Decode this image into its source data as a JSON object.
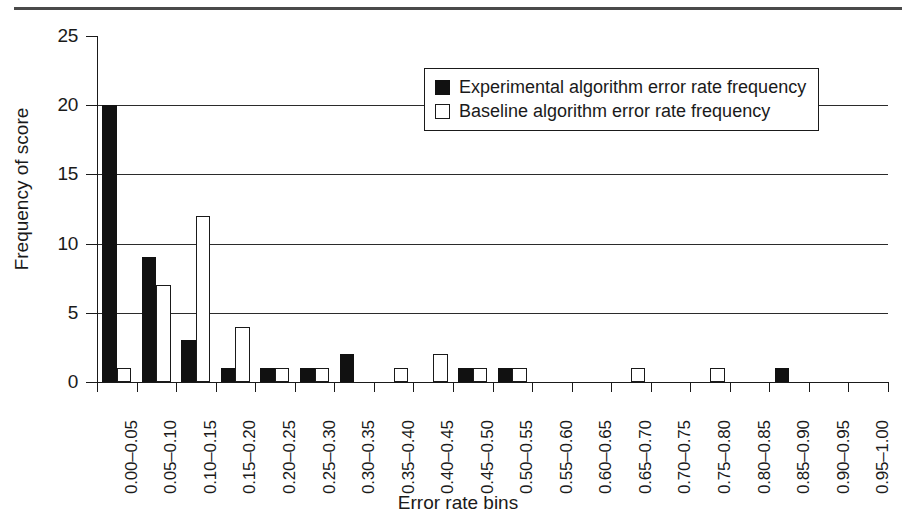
{
  "chart_data": {
    "type": "bar",
    "title": "",
    "xlabel": "Error rate bins",
    "ylabel": "Frequency of score",
    "ylim": [
      0,
      25
    ],
    "yticks": [
      0,
      5,
      10,
      15,
      20,
      25
    ],
    "gridlines": [
      5,
      10,
      15,
      20
    ],
    "grid": true,
    "legend_position": "upper-right-inside",
    "categories": [
      "0.00–0.05",
      "0.05–0.10",
      "0.10–0.15",
      "0.15–0.20",
      "0.20–0.25",
      "0.25–0.30",
      "0.30–0.35",
      "0.35–0.40",
      "0.40–0.45",
      "0.45–0.50",
      "0.50–0.55",
      "0.55–0.60",
      "0.60–0.65",
      "0.65–0.70",
      "0.70–0.75",
      "0.75–0.80",
      "0.80–0.85",
      "0.85–0.90",
      "0.90–0.95",
      "0.95–1.00"
    ],
    "series": [
      {
        "name": "Experimental algorithm error rate frequency",
        "color": "#111111",
        "style": "filled",
        "values": [
          20,
          9,
          3,
          1,
          1,
          1,
          2,
          0,
          0,
          1,
          1,
          0,
          0,
          0,
          0,
          0,
          0,
          1,
          0,
          0
        ]
      },
      {
        "name": "Baseline algorithm error rate frequency",
        "color": "#ffffff",
        "style": "outlined",
        "values": [
          1,
          7,
          12,
          4,
          1,
          1,
          0,
          1,
          2,
          1,
          1,
          0,
          0,
          1,
          0,
          1,
          0,
          0,
          0,
          0
        ]
      }
    ]
  },
  "legend": {
    "items": [
      {
        "label": "Experimental algorithm error rate frequency",
        "swatch": "filled-square"
      },
      {
        "label": "Baseline algorithm error rate frequency",
        "swatch": "open-square"
      }
    ]
  },
  "axes": {
    "y_title": "Frequency of score",
    "x_title": "Error rate bins",
    "y_tick_labels": [
      "0",
      "5",
      "10",
      "15",
      "20",
      "25"
    ]
  }
}
